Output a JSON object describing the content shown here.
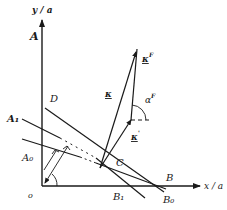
{
  "figure": {
    "axes": {
      "x_label": "x / a",
      "y_label": "y / a",
      "origin_label": "o"
    },
    "points": {
      "A": "A",
      "A1": "A₁",
      "A0": "A₀",
      "B": "B",
      "B1": "B₁",
      "B0": "B₀",
      "C": "C",
      "D": "D"
    },
    "vectors": {
      "kappa": "κ",
      "kappa_F": "κ",
      "kappa_F_sup": "F",
      "kappa_prime": "κ",
      "kappa_prime_sup": "'"
    },
    "angles": {
      "alpha_F": "α",
      "alpha_F_sup": "F"
    },
    "colors": {
      "ink": "#1a1a1a",
      "background": "#ffffff"
    }
  }
}
